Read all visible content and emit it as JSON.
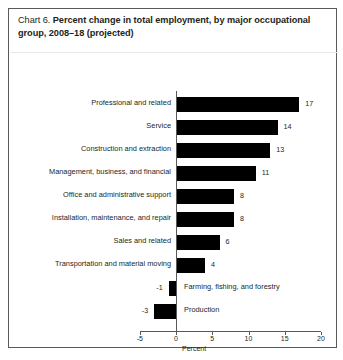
{
  "figure": {
    "label_prefix": "Chart 6.",
    "title": "Percent change in total employment, by major occupational group, 2008–18 (projected)"
  },
  "chart_data": {
    "type": "bar",
    "orientation": "horizontal",
    "title": "Percent change in total employment, by major occupational group, 2008–18 (projected)",
    "xlabel": "Percent",
    "ylabel": "",
    "xlim": [
      -5,
      20
    ],
    "xticks": [
      -5,
      0,
      5,
      10,
      15,
      20
    ],
    "xtick_labels": [
      "-5",
      "0",
      "5",
      "10",
      "15",
      "20"
    ],
    "grid": false,
    "legend": "none",
    "bar_color": "#000000",
    "categories": [
      "Professional and related",
      "Service",
      "Construction and extraction",
      "Management, business, and financial",
      "Office and administrative support",
      "Installation, maintenance, and repair",
      "Sales and related",
      "Transportation and material moving",
      "Farming, fishing, and forestry",
      "Production"
    ],
    "values": [
      17,
      14,
      13,
      11,
      8,
      8,
      6,
      4,
      -1,
      -3
    ],
    "value_labels": [
      "17",
      "14",
      "13",
      "11",
      "8",
      "8",
      "6",
      "4",
      "-1",
      "-3"
    ]
  },
  "axis": {
    "ticks": [
      {
        "value": -5,
        "label": "-5"
      },
      {
        "value": 0,
        "label": "0"
      },
      {
        "value": 5,
        "label": "5"
      },
      {
        "value": 10,
        "label": "10"
      },
      {
        "value": 15,
        "label": "15"
      },
      {
        "value": 20,
        "label": "20"
      }
    ],
    "title": "Percent"
  }
}
